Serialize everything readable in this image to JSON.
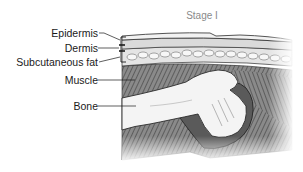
{
  "diagram": {
    "title": "Stage I",
    "labels": [
      {
        "id": "epidermis",
        "text": "Epidermis"
      },
      {
        "id": "dermis",
        "text": "Dermis"
      },
      {
        "id": "subcutaneous-fat",
        "text": "Subcutaneous fat"
      },
      {
        "id": "muscle",
        "text": "Muscle"
      },
      {
        "id": "bone",
        "text": "Bone"
      }
    ],
    "colors": {
      "outline": "#2b2b2b",
      "skin": "#f2f2f2",
      "dermis": "#dcdcdc",
      "fat": "#e8e8e8",
      "muscle": "#6e6e6e",
      "joint": "#5a5a5a",
      "bone": "#f4f4f4",
      "title": "#8a8a8a"
    }
  }
}
